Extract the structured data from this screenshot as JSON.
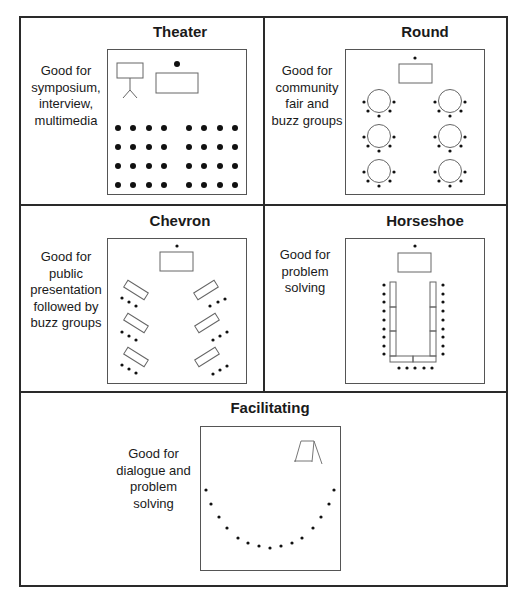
{
  "panels": {
    "theater": {
      "title": "Theater",
      "description": [
        "Good for",
        "symposium,",
        "interview,",
        "multimedia"
      ]
    },
    "round": {
      "title": "Round",
      "description": [
        "Good for",
        "community",
        "fair and",
        "buzz groups"
      ]
    },
    "chevron": {
      "title": "Chevron",
      "description": [
        "Good for",
        "public",
        "presentation",
        "followed by",
        "buzz groups"
      ]
    },
    "horseshoe": {
      "title": "Horseshoe",
      "description": [
        "Good for",
        "problem",
        "solving"
      ]
    },
    "facilitating": {
      "title": "Facilitating",
      "description": [
        "Good for",
        "dialogue and",
        "problem solving"
      ]
    }
  },
  "colors": {
    "line": "#2a2a2a",
    "diagram_line": "#666666",
    "dot": "#111111"
  }
}
